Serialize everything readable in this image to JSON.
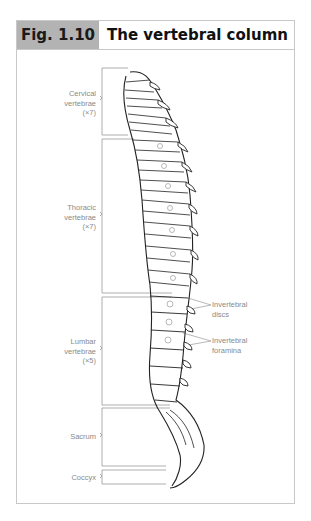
{
  "figure": {
    "number": "Fig. 1.10",
    "title": "The vertebral column"
  },
  "regions": [
    {
      "name": "Cervical vertebrae",
      "line1": "Cervical",
      "line2": "vertebrae",
      "count": "(×7)"
    },
    {
      "name": "Thoracic vertebrae",
      "line1": "Thoracic",
      "line2": "vertebrae",
      "count": "(×7)"
    },
    {
      "name": "Lumbar vertebrae",
      "line1": "Lumbar",
      "line2": "vertebrae",
      "count": "(×5)"
    },
    {
      "name": "Sacrum",
      "line1": "Sacrum"
    },
    {
      "name": "Coccyx",
      "line1": "Coccyx"
    }
  ],
  "callouts": [
    {
      "line1": "Invertebral",
      "line2": "discs"
    },
    {
      "line1": "Invertebral",
      "line2": "foramina"
    }
  ],
  "colors": {
    "header_fill": "#b3b3b3",
    "border": "#c8c8c8",
    "label_text": "#8a8a8a",
    "line_art": "#222222"
  }
}
